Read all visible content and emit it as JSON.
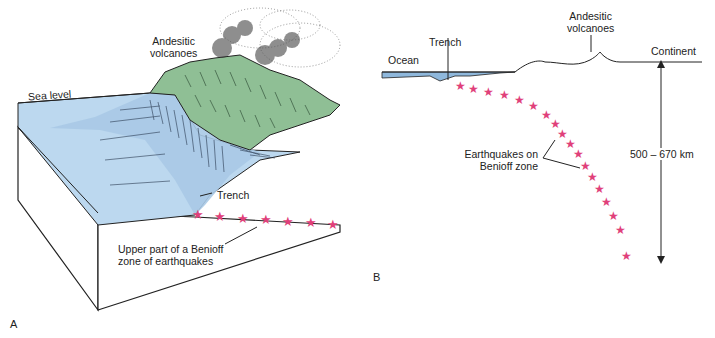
{
  "colors": {
    "sea": "#bcd8ef",
    "sea_dark": "#8fb8dc",
    "land": "#8fbf95",
    "star": "#e0407a",
    "ink": "#222222"
  },
  "panel_a": {
    "letter": "A",
    "labels": {
      "volcanoes_line1": "Andesitic",
      "volcanoes_line2": "volcanoes",
      "sea_level": "Sea level",
      "trench": "Trench",
      "benioff_line1": "Upper part of a Benioff",
      "benioff_line2": "zone of earthquakes"
    },
    "star_count": 7
  },
  "panel_b": {
    "letter": "B",
    "labels": {
      "ocean": "Ocean",
      "trench": "Trench",
      "volcanoes_line1": "Andesitic",
      "volcanoes_line2": "volcanoes",
      "continent": "Continent",
      "earthquakes_line1": "Earthquakes on",
      "earthquakes_line2": "Benioff zone",
      "depth": "500 – 670 km"
    },
    "star_count": 18
  }
}
